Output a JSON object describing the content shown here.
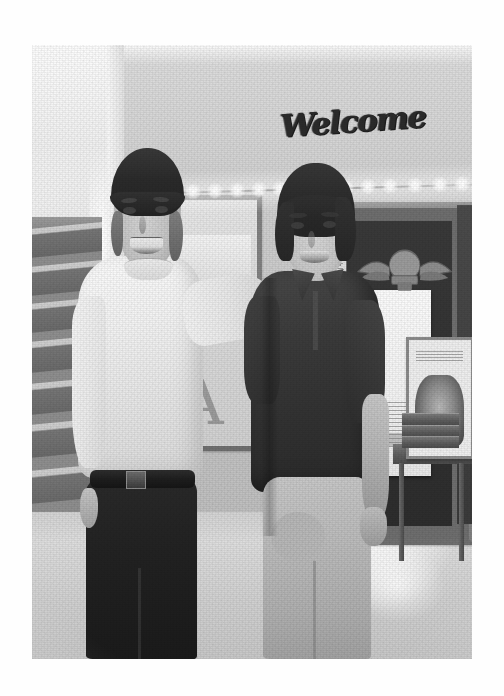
{
  "page": {
    "background_color": "#fefefe",
    "type": "scanned-photograph-page"
  },
  "photo": {
    "caption": "Two young men standing side by side with arms around each other in an indoor lobby",
    "tone": "black-and-white",
    "left_px": 32,
    "top_px": 45,
    "width_px": 440,
    "height_px": 614,
    "border_color": "#b9b9b9"
  },
  "scene": {
    "signage": {
      "welcome_text": "Welcome",
      "welcome_style": "cursive script wall letters",
      "welcome_color": "#2c2c2c"
    },
    "poster": {
      "letter": "A"
    },
    "lights": {
      "label": "string lights",
      "bulb_count": 14,
      "bulb_color": "#ffffff"
    },
    "boards": {
      "left_label": "bulletin-board-left",
      "right_label": "bulletin-board-right",
      "frame_color": "#8b8b8b",
      "right_interior_color": "#333333"
    },
    "emblem": {
      "label": "winged emblem plaque",
      "color": "#8a8a8a"
    },
    "stairs": {
      "label": "staircase",
      "step_count": 9,
      "tread_color": "#6a6a6a"
    },
    "table": {
      "label": "side table",
      "color": "#5e5e5e"
    },
    "framed_picture": {
      "label": "framed animal photograph",
      "frame_color": "#8b8b8b"
    },
    "floor": {
      "label": "polished tile floor",
      "color": "#cfcfcf"
    }
  },
  "people": [
    {
      "id": "person-left",
      "position": "left",
      "headwear": "dark knit beanie",
      "headwear_color": "#2c2c2c",
      "top": "cream crewneck sweater",
      "top_color": "#f3f1ec",
      "bottom": "dark trousers",
      "bottom_color": "#232323",
      "accessory": "dark belt with buckle",
      "pose": "right arm around companion's shoulder, left hand in pocket",
      "expression": "smiling"
    },
    {
      "id": "person-right",
      "position": "right",
      "hair": "dark wavy hair",
      "hair_color": "#2d2d2d",
      "top": "dark short-sleeve polo shirt",
      "top_color": "#3c3c3c",
      "bottom": "khaki shorts",
      "bottom_color": "#c4baab",
      "pose": "arms relaxed at sides",
      "expression": "smiling"
    }
  ]
}
